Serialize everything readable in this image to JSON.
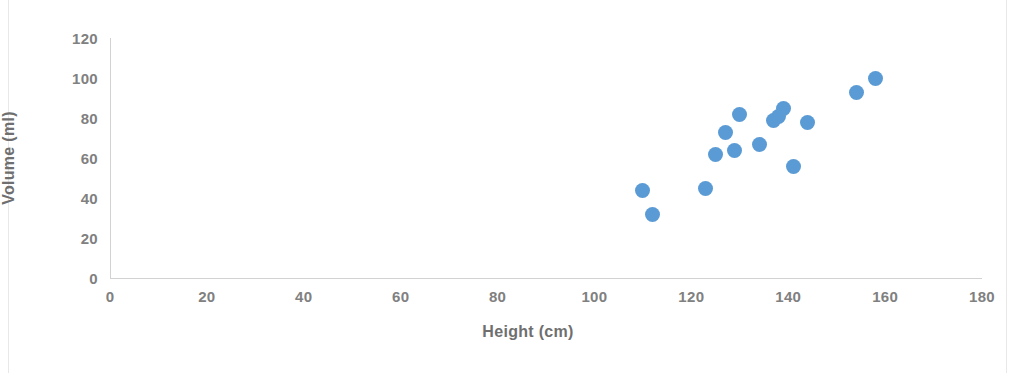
{
  "chart_data": {
    "type": "scatter",
    "title": "",
    "xlabel": "Height (cm)",
    "ylabel": "Volume (ml)",
    "xlim": [
      0,
      180
    ],
    "ylim": [
      0,
      120
    ],
    "xticks": [
      0,
      20,
      40,
      60,
      80,
      100,
      120,
      140,
      160,
      180
    ],
    "yticks": [
      0,
      20,
      40,
      60,
      80,
      100,
      120
    ],
    "grid": false,
    "legend": null,
    "marker_color": "#5B9BD5",
    "axis_color": "#D2D2D2",
    "tick_label_color": "#808080",
    "series": [
      {
        "name": "Volume vs Height",
        "x": [
          110,
          112,
          123,
          125,
          127,
          129,
          130,
          134,
          137,
          138,
          139,
          141,
          144,
          154,
          158
        ],
        "y": [
          44,
          32,
          45,
          62,
          73,
          64,
          82,
          67,
          79,
          81,
          85,
          56,
          78,
          93,
          100
        ],
        "points": [
          {
            "x": 110,
            "y": 44
          },
          {
            "x": 112,
            "y": 32
          },
          {
            "x": 123,
            "y": 45
          },
          {
            "x": 125,
            "y": 62
          },
          {
            "x": 127,
            "y": 73
          },
          {
            "x": 129,
            "y": 64
          },
          {
            "x": 130,
            "y": 82
          },
          {
            "x": 134,
            "y": 67
          },
          {
            "x": 137,
            "y": 79
          },
          {
            "x": 138,
            "y": 81
          },
          {
            "x": 139,
            "y": 85
          },
          {
            "x": 141,
            "y": 56
          },
          {
            "x": 144,
            "y": 78
          },
          {
            "x": 154,
            "y": 93
          },
          {
            "x": 158,
            "y": 100
          }
        ]
      }
    ]
  },
  "axes": {
    "x_title": "Height (cm)",
    "y_title": "Volume (ml)",
    "x_tick_labels": [
      "0",
      "20",
      "40",
      "60",
      "80",
      "100",
      "120",
      "140",
      "160",
      "180"
    ],
    "y_tick_labels": [
      "0",
      "20",
      "40",
      "60",
      "80",
      "100",
      "120"
    ]
  }
}
